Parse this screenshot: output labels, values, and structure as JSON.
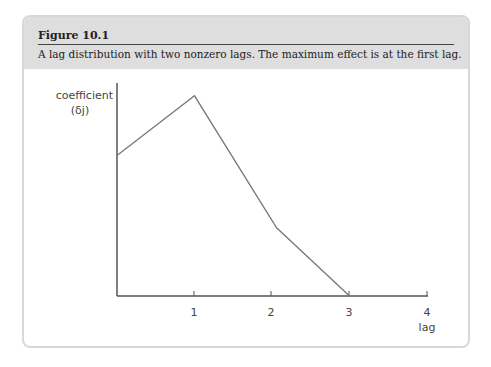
{
  "figure": {
    "title": "Figure 10.1",
    "caption": "A lag distribution with two nonzero lags. The maximum effect is at the first lag."
  },
  "chart_data": {
    "type": "line",
    "title": "Figure 10.1",
    "subtitle": "A lag distribution with two nonzero lags. The maximum effect is at the first lag.",
    "xlabel": "lag",
    "ylabel": "coefficient (δj)",
    "ylabel_lines": [
      "coefficient",
      "(δj)"
    ],
    "x_ticks": [
      "1",
      "2",
      "3",
      "4"
    ],
    "x": [
      0,
      1,
      2.06,
      3
    ],
    "values": [
      0.66,
      0.94,
      0.32,
      0
    ],
    "xlim": [
      0,
      4
    ],
    "ylim": [
      0,
      1
    ],
    "grid": false,
    "legend": null,
    "colors": {
      "line": "#777777",
      "axis": "#555555"
    }
  }
}
